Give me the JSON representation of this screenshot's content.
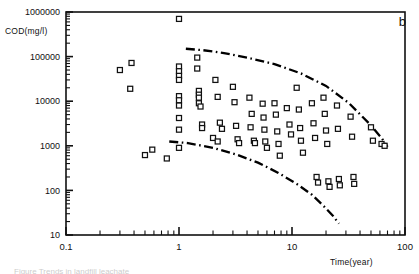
{
  "figure": {
    "panel_letter": "b",
    "caption_fragment": "Figure   Trends in landfill leachate"
  },
  "chart_data": {
    "type": "scatter",
    "title": "",
    "xlabel": "Time(year)",
    "ylabel": "COD(mg/l)",
    "xscale": "log",
    "yscale": "log",
    "xlim": [
      0.1,
      100
    ],
    "ylim": [
      10,
      1000000
    ],
    "xticks": [
      0.1,
      1,
      10,
      100
    ],
    "xtick_labels": [
      "0.1",
      "1",
      "10",
      "100"
    ],
    "yticks": [
      10,
      100,
      1000,
      10000,
      100000,
      1000000
    ],
    "ytick_labels": [
      "10",
      "100",
      "1000",
      "10000",
      "100000",
      "1000000"
    ],
    "grid": false,
    "legend": null,
    "marker": "open-square",
    "series": [
      {
        "name": "COD observations",
        "points": [
          [
            0.3,
            50000
          ],
          [
            0.38,
            72000
          ],
          [
            0.37,
            19000
          ],
          [
            0.5,
            620
          ],
          [
            0.58,
            820
          ],
          [
            0.78,
            520
          ],
          [
            1.0,
            700000
          ],
          [
            1.0,
            60000
          ],
          [
            1.0,
            47000
          ],
          [
            1.0,
            37000
          ],
          [
            1.0,
            30000
          ],
          [
            1.0,
            13000
          ],
          [
            1.0,
            10500
          ],
          [
            1.0,
            8000
          ],
          [
            1.0,
            4200
          ],
          [
            1.0,
            2300
          ],
          [
            1.0,
            900
          ],
          [
            1.45,
            95000
          ],
          [
            1.45,
            54000
          ],
          [
            1.5,
            17000
          ],
          [
            1.5,
            14000
          ],
          [
            1.5,
            12000
          ],
          [
            1.5,
            9000
          ],
          [
            1.55,
            7600
          ],
          [
            1.6,
            3000
          ],
          [
            1.6,
            2500
          ],
          [
            2.1,
            30000
          ],
          [
            2.2,
            12500
          ],
          [
            2.3,
            3300
          ],
          [
            2.4,
            2400
          ],
          [
            2.0,
            1500
          ],
          [
            2.2,
            1250
          ],
          [
            3.0,
            21000
          ],
          [
            3.1,
            9500
          ],
          [
            3.2,
            2800
          ],
          [
            3.3,
            1400
          ],
          [
            3.4,
            1150
          ],
          [
            4.2,
            12000
          ],
          [
            4.4,
            5200
          ],
          [
            4.3,
            2600
          ],
          [
            4.6,
            1300
          ],
          [
            4.7,
            1150
          ],
          [
            5.5,
            8800
          ],
          [
            5.6,
            4300
          ],
          [
            5.7,
            2300
          ],
          [
            5.8,
            1250
          ],
          [
            6.0,
            900
          ],
          [
            7.0,
            9000
          ],
          [
            7.2,
            5000
          ],
          [
            7.4,
            2100
          ],
          [
            7.6,
            1100
          ],
          [
            7.8,
            600
          ],
          [
            9.0,
            7000
          ],
          [
            9.5,
            3000
          ],
          [
            9.8,
            1800
          ],
          [
            11.0,
            20000
          ],
          [
            11.5,
            6500
          ],
          [
            11.8,
            2500
          ],
          [
            12.0,
            1300
          ],
          [
            12.5,
            700
          ],
          [
            15.0,
            9000
          ],
          [
            15.5,
            3200
          ],
          [
            16.0,
            1500
          ],
          [
            16.5,
            200
          ],
          [
            17.0,
            150
          ],
          [
            19.0,
            12000
          ],
          [
            19.5,
            5200
          ],
          [
            20.0,
            2200
          ],
          [
            20.5,
            1100
          ],
          [
            21.0,
            160
          ],
          [
            21.5,
            120
          ],
          [
            25.0,
            8000
          ],
          [
            25.5,
            2400
          ],
          [
            26.0,
            180
          ],
          [
            26.5,
            130
          ],
          [
            33.0,
            4500
          ],
          [
            34.0,
            1600
          ],
          [
            35.0,
            200
          ],
          [
            35.5,
            140
          ],
          [
            50.0,
            2600
          ],
          [
            52.0,
            1300
          ],
          [
            62.0,
            1100
          ],
          [
            66.0,
            1000
          ]
        ]
      }
    ],
    "bound_curves": [
      {
        "name": "upper-envelope",
        "style": "dash-dot",
        "points": [
          [
            1.15,
            150000
          ],
          [
            1.6,
            140000
          ],
          [
            2.5,
            120000
          ],
          [
            4.0,
            95000
          ],
          [
            7.0,
            68000
          ],
          [
            12.0,
            42000
          ],
          [
            20.0,
            22000
          ],
          [
            32.0,
            9000
          ],
          [
            48.0,
            3200
          ],
          [
            62.0,
            1500
          ],
          [
            70.0,
            950
          ]
        ]
      },
      {
        "name": "lower-envelope",
        "style": "dash-dot",
        "points": [
          [
            0.82,
            1250
          ],
          [
            1.2,
            1150
          ],
          [
            2.0,
            900
          ],
          [
            3.2,
            640
          ],
          [
            5.0,
            420
          ],
          [
            7.5,
            250
          ],
          [
            11.0,
            140
          ],
          [
            15.0,
            80
          ],
          [
            19.0,
            45
          ],
          [
            23.0,
            27
          ],
          [
            26.0,
            18
          ]
        ]
      }
    ]
  }
}
